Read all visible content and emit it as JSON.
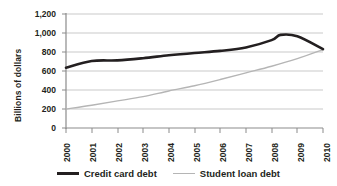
{
  "chart_data": {
    "type": "line",
    "title": "",
    "xlabel": "",
    "ylabel": "Billions of dollars",
    "x": [
      2000,
      2001,
      2002,
      2003,
      2004,
      2005,
      2006,
      2007,
      2008,
      2009,
      2010
    ],
    "categories": [
      "2000",
      "2001",
      "2002",
      "2003",
      "2004",
      "2005",
      "2006",
      "2007",
      "2008",
      "2009",
      "2010"
    ],
    "xlim": [
      2000,
      2010
    ],
    "ylim": [
      0,
      1200
    ],
    "ytick_labels": [
      "0",
      "200",
      "400",
      "600",
      "800",
      "1,000",
      "1,200"
    ],
    "ytick_values": [
      0,
      200,
      400,
      600,
      800,
      1000,
      1200
    ],
    "grid": true,
    "grid_axis": "y",
    "legend_position": "bottom",
    "series": [
      {
        "name": "Credit card debt",
        "color": "#231f20",
        "width": 2.6,
        "values": [
          635,
          705,
          712,
          735,
          765,
          790,
          812,
          848,
          925,
          965,
          830
        ],
        "peak_value": 980,
        "peak_year": 2008.35
      },
      {
        "name": "Student loan debt",
        "color": "#b5b5b5",
        "width": 1.4,
        "values": [
          200,
          240,
          285,
          330,
          390,
          445,
          510,
          580,
          650,
          730,
          825
        ]
      }
    ]
  },
  "legend": {
    "items": [
      {
        "label": "Credit card debt",
        "style": "thick"
      },
      {
        "label": "Student loan debt",
        "style": "thin"
      }
    ]
  }
}
